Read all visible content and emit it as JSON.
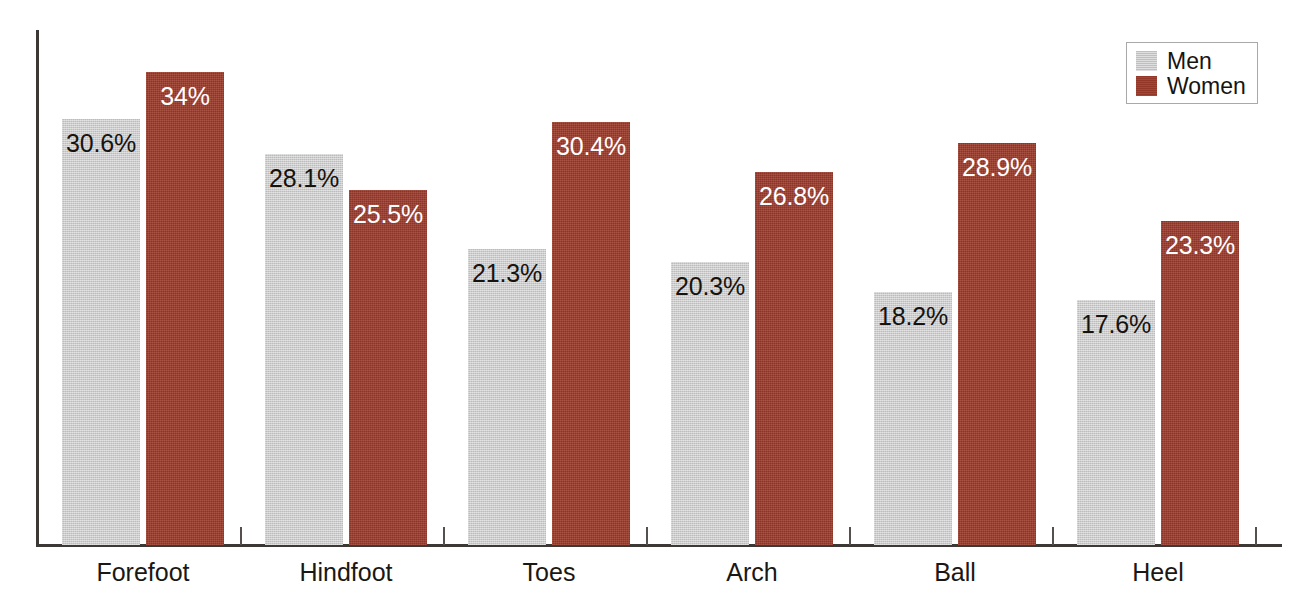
{
  "chart_data": {
    "type": "bar",
    "title": "",
    "subtitle": "",
    "xlabel": "",
    "ylabel": "",
    "ylim": [
      0,
      37
    ],
    "grid": false,
    "legend_position": "top-right",
    "categories": [
      "Forefoot",
      "Hindfoot",
      "Toes",
      "Arch",
      "Ball",
      "Heel"
    ],
    "series": [
      {
        "name": "Men",
        "color": "#c9c9c9",
        "label_color": "#16130f",
        "values": [
          30.6,
          28.1,
          21.3,
          20.3,
          18.2,
          17.6
        ],
        "value_labels": [
          "30.6%",
          "28.1%",
          "21.3%",
          "20.3%",
          "18.2%",
          "17.6%"
        ]
      },
      {
        "name": "Women",
        "color": "#9c3b2c",
        "label_color": "#ffffff",
        "values": [
          34.0,
          25.5,
          30.4,
          26.8,
          28.9,
          23.3
        ],
        "value_labels": [
          "34%",
          "25.5%",
          "30.4%",
          "26.8%",
          "28.9%",
          "23.3%"
        ]
      }
    ]
  },
  "legend": {
    "items": [
      {
        "label": "Men",
        "color": "#c9c9c9"
      },
      {
        "label": "Women",
        "color": "#9c3b2c"
      }
    ]
  },
  "axes": {
    "axis_color": "#3b3836",
    "tick_color": "#55504e",
    "y_tick_labels": [],
    "x_tick_labels": [
      "Forefoot",
      "Hindfoot",
      "Toes",
      "Arch",
      "Ball",
      "Heel"
    ]
  }
}
